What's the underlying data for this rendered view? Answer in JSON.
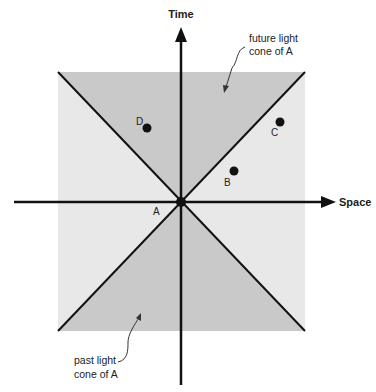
{
  "diagram": {
    "axes": {
      "time_label": "Time",
      "space_label": "Space"
    },
    "regions": {
      "future_cone_label_line1": "future light",
      "future_cone_label_line2": "cone of A",
      "past_cone_label_line1": "past light",
      "past_cone_label_line2": "cone of A"
    },
    "events": [
      {
        "label": "A",
        "role": "origin"
      },
      {
        "label": "B",
        "role": "outside-cone"
      },
      {
        "label": "C",
        "role": "outside-cone"
      },
      {
        "label": "D",
        "role": "inside-future-cone"
      }
    ],
    "colors": {
      "cone_fill": "#c9c9c9",
      "elsewhere_fill": "#e8e8e8",
      "ink": "#111111"
    }
  }
}
